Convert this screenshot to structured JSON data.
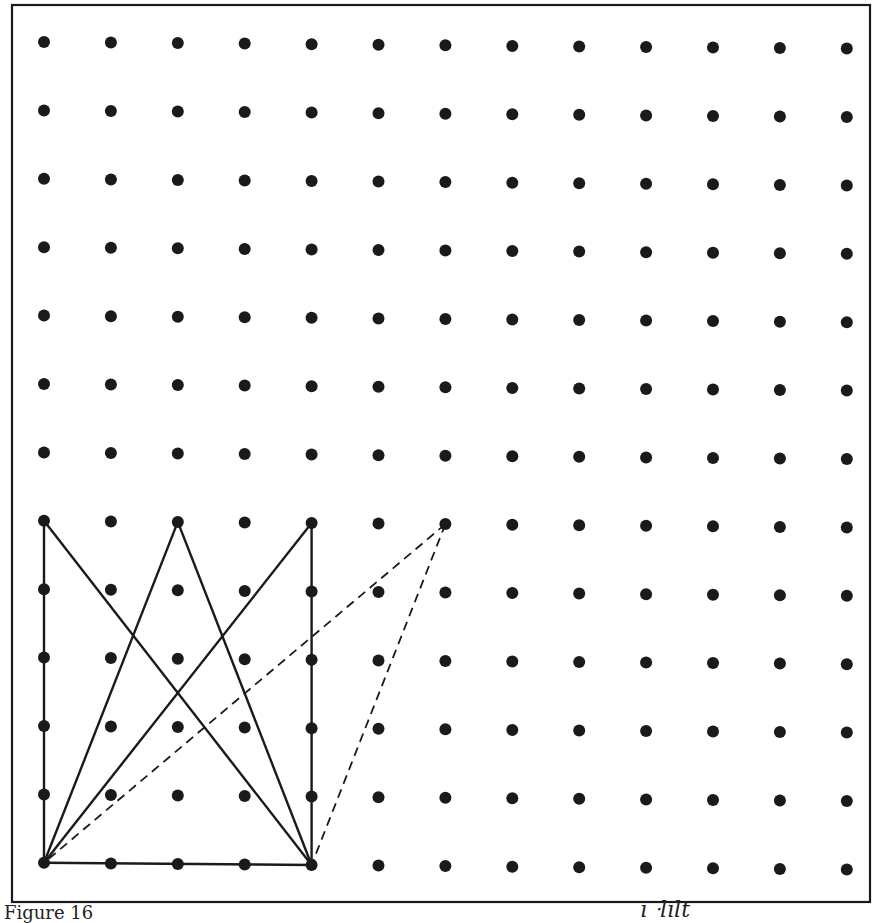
{
  "figure": {
    "caption": "Figure 16",
    "handwritten_note": "ı ᐧlılt",
    "colors": {
      "ink": "#1a1a1a",
      "paper": "#ffffff"
    },
    "grid": {
      "columns": 13,
      "rows": 13,
      "origin_x": 44,
      "origin_y": 42,
      "spacing_x": 66.9,
      "spacing_y": 68.4,
      "row_drift_per_col": 0.55,
      "dot_radius": 6
    },
    "frame": {
      "x": 12,
      "y": 5,
      "width": 858,
      "height": 897
    },
    "solid_segments": [
      {
        "from": [
          0,
          7
        ],
        "to": [
          0,
          12
        ]
      },
      {
        "from": [
          0,
          12
        ],
        "to": [
          4,
          12
        ]
      },
      {
        "from": [
          4,
          7
        ],
        "to": [
          4,
          12
        ]
      },
      {
        "from": [
          0,
          7
        ],
        "to": [
          4,
          12
        ]
      },
      {
        "from": [
          2,
          7
        ],
        "to": [
          0,
          12
        ]
      },
      {
        "from": [
          2,
          7
        ],
        "to": [
          4,
          12
        ]
      },
      {
        "from": [
          4,
          7
        ],
        "to": [
          0,
          12
        ]
      }
    ],
    "dashed_segments": [
      {
        "from": [
          6,
          7
        ],
        "to": [
          0,
          12
        ]
      },
      {
        "from": [
          6,
          7
        ],
        "to": [
          4,
          12
        ]
      }
    ]
  }
}
